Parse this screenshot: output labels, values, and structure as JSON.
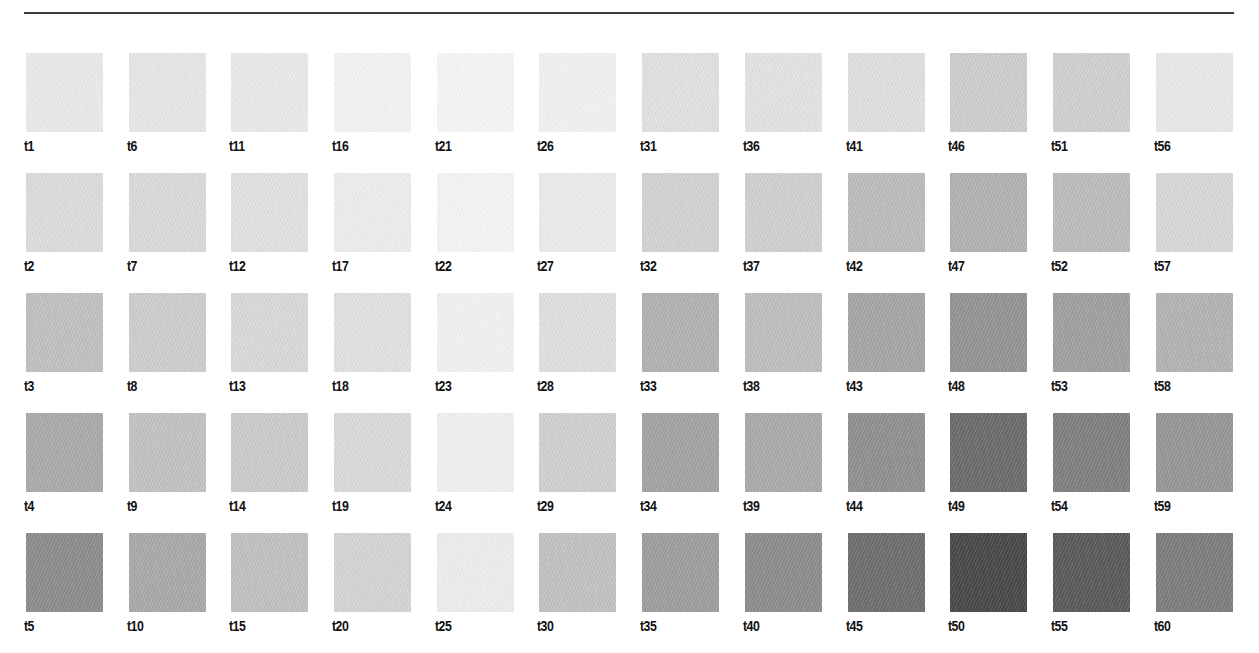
{
  "page": {
    "rule_color": "#3a3a3a"
  },
  "swatches": {
    "columns": [
      {
        "items": [
          {
            "label": "t1",
            "color": "#ececec"
          },
          {
            "label": "t2",
            "color": "#dedede"
          },
          {
            "label": "t3",
            "color": "#c2c2c2"
          },
          {
            "label": "t4",
            "color": "#acacac"
          },
          {
            "label": "t5",
            "color": "#8f8f8f"
          }
        ]
      },
      {
        "items": [
          {
            "label": "t6",
            "color": "#e9e9e9"
          },
          {
            "label": "t7",
            "color": "#dcdcdc"
          },
          {
            "label": "t8",
            "color": "#cfcfcf"
          },
          {
            "label": "t9",
            "color": "#c4c4c4"
          },
          {
            "label": "t10",
            "color": "#ababab"
          }
        ]
      },
      {
        "items": [
          {
            "label": "t11",
            "color": "#ececec"
          },
          {
            "label": "t12",
            "color": "#e3e3e3"
          },
          {
            "label": "t13",
            "color": "#dbdbdb"
          },
          {
            "label": "t14",
            "color": "#cdcdcd"
          },
          {
            "label": "t15",
            "color": "#c2c2c2"
          }
        ]
      },
      {
        "items": [
          {
            "label": "t16",
            "color": "#f6f6f6"
          },
          {
            "label": "t17",
            "color": "#efefef"
          },
          {
            "label": "t18",
            "color": "#e3e3e3"
          },
          {
            "label": "t19",
            "color": "#dcdcdc"
          },
          {
            "label": "t20",
            "color": "#d6d6d6"
          }
        ]
      },
      {
        "items": [
          {
            "label": "t21",
            "color": "#f8f8f8"
          },
          {
            "label": "t22",
            "color": "#f7f7f7"
          },
          {
            "label": "t23",
            "color": "#f4f4f4"
          },
          {
            "label": "t24",
            "color": "#f2f2f2"
          },
          {
            "label": "t25",
            "color": "#efefef"
          }
        ]
      },
      {
        "items": [
          {
            "label": "t26",
            "color": "#f4f4f4"
          },
          {
            "label": "t27",
            "color": "#ededed"
          },
          {
            "label": "t28",
            "color": "#e2e2e2"
          },
          {
            "label": "t29",
            "color": "#d2d2d2"
          },
          {
            "label": "t30",
            "color": "#c4c4c4"
          }
        ]
      },
      {
        "items": [
          {
            "label": "t31",
            "color": "#e3e3e3"
          },
          {
            "label": "t32",
            "color": "#d4d4d4"
          },
          {
            "label": "t33",
            "color": "#b3b3b3"
          },
          {
            "label": "t34",
            "color": "#a5a5a5"
          },
          {
            "label": "t35",
            "color": "#a0a0a0"
          }
        ]
      },
      {
        "items": [
          {
            "label": "t36",
            "color": "#e5e5e5"
          },
          {
            "label": "t37",
            "color": "#d2d2d2"
          },
          {
            "label": "t38",
            "color": "#c0c0c0"
          },
          {
            "label": "t39",
            "color": "#acacac"
          },
          {
            "label": "t40",
            "color": "#8f8f8f"
          }
        ]
      },
      {
        "items": [
          {
            "label": "t41",
            "color": "#e2e2e2"
          },
          {
            "label": "t42",
            "color": "#bdbdbd"
          },
          {
            "label": "t43",
            "color": "#a7a7a7"
          },
          {
            "label": "t44",
            "color": "#929292"
          },
          {
            "label": "t45",
            "color": "#6f6f6f"
          }
        ]
      },
      {
        "items": [
          {
            "label": "t46",
            "color": "#cfcfcf"
          },
          {
            "label": "t47",
            "color": "#b3b3b3"
          },
          {
            "label": "t48",
            "color": "#959595"
          },
          {
            "label": "t49",
            "color": "#6d6d6d"
          },
          {
            "label": "t50",
            "color": "#4a4a4a"
          }
        ]
      },
      {
        "items": [
          {
            "label": "t51",
            "color": "#d2d2d2"
          },
          {
            "label": "t52",
            "color": "#bdbdbd"
          },
          {
            "label": "t53",
            "color": "#a1a1a1"
          },
          {
            "label": "t54",
            "color": "#828282"
          },
          {
            "label": "t55",
            "color": "#5b5b5b"
          }
        ]
      },
      {
        "items": [
          {
            "label": "t56",
            "color": "#ebebeb"
          },
          {
            "label": "t57",
            "color": "#dadada"
          },
          {
            "label": "t58",
            "color": "#b5b5b5"
          },
          {
            "label": "t59",
            "color": "#999999"
          },
          {
            "label": "t60",
            "color": "#7f7f7f"
          }
        ]
      }
    ]
  }
}
